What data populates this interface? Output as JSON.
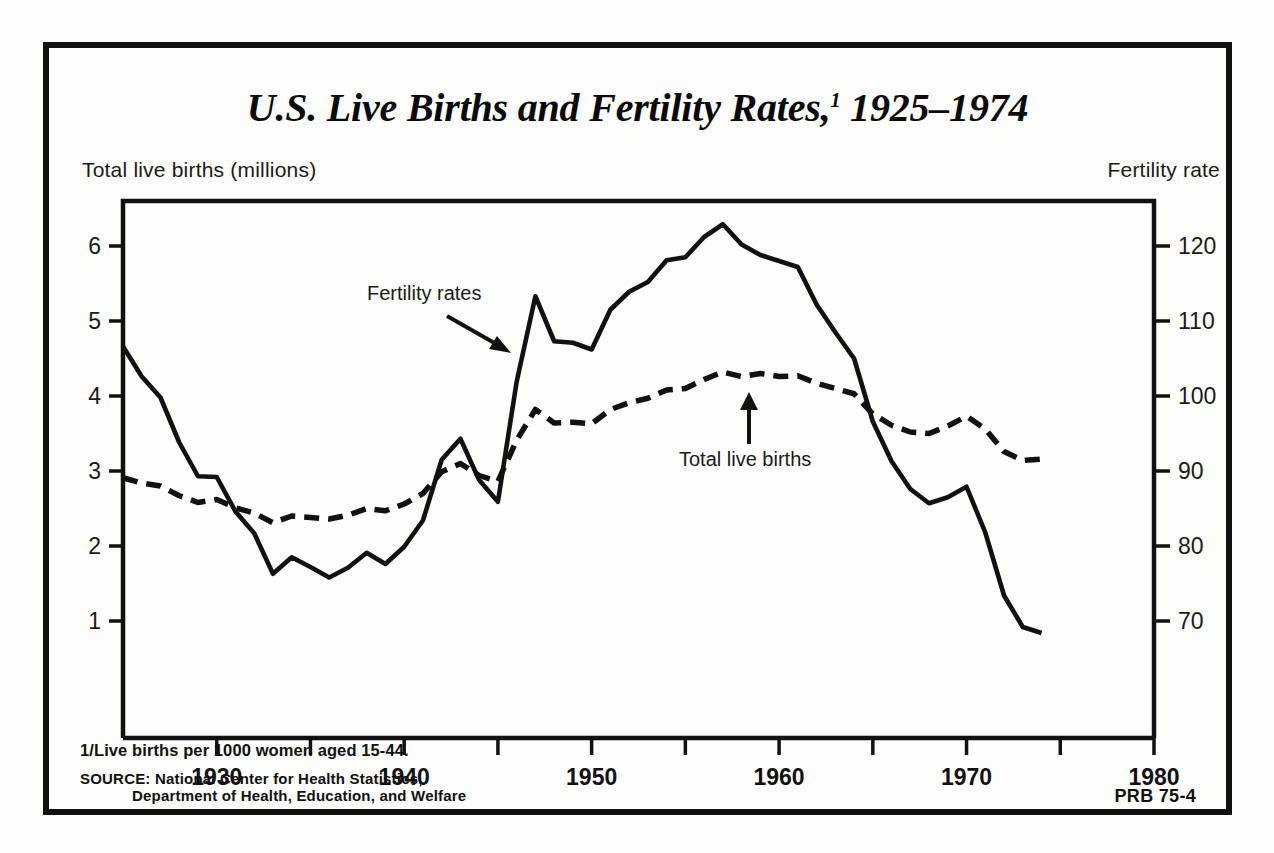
{
  "poster": {
    "title_main": "U.S. Live Births and Fertility Rates,",
    "title_footnote_marker": "1",
    "title_years": " 1925–1974",
    "footnote": "1/Live births per 1000 women aged 15-44.",
    "source_line1": "SOURCE: National Center for Health Statistics,",
    "source_line2": "Department of Health, Education, and Welfare",
    "publication_code": "PRB 75-4",
    "left_axis_caption": "Total live births (millions)",
    "right_axis_caption": "Fertility rate"
  },
  "chart_data": {
    "type": "line",
    "xlabel": "",
    "ylabel": "Total live births (millions)",
    "y2label": "Fertility rate",
    "xlim": [
      1925,
      1980
    ],
    "ylim": [
      0,
      6.6
    ],
    "y2lim": [
      60,
      126
    ],
    "grid": false,
    "legend_position": "inline-annotations",
    "xticks_major": [
      1930,
      1940,
      1950,
      1960,
      1970,
      1980
    ],
    "xticks_minor": [
      1935,
      1945,
      1955,
      1965,
      1975
    ],
    "yticks_left": [
      1,
      2,
      3,
      4,
      5,
      6
    ],
    "yticks_right": [
      70,
      80,
      90,
      100,
      110,
      120
    ],
    "annotations": [
      {
        "text": "Fertility rates",
        "points_to_series": "fertility_rate",
        "arrow": "down-right",
        "x": 1939,
        "y2": 112
      },
      {
        "text": "Total live births",
        "points_to_series": "total_live_births",
        "arrow": "up",
        "x": 1955,
        "y": 3.75
      }
    ],
    "x": [
      1925,
      1926,
      1927,
      1928,
      1929,
      1930,
      1931,
      1932,
      1933,
      1934,
      1935,
      1936,
      1937,
      1938,
      1939,
      1940,
      1941,
      1942,
      1943,
      1944,
      1945,
      1946,
      1947,
      1948,
      1949,
      1950,
      1951,
      1952,
      1953,
      1954,
      1955,
      1956,
      1957,
      1958,
      1959,
      1960,
      1961,
      1962,
      1963,
      1964,
      1965,
      1966,
      1967,
      1968,
      1969,
      1970,
      1971,
      1972,
      1973,
      1974
    ],
    "series": [
      {
        "name": "Fertility rates",
        "key": "fertility_rate",
        "axis": "right",
        "style": "solid",
        "units": "live births per 1000 women aged 15-44",
        "values": [
          106.6,
          102.6,
          99.8,
          93.8,
          89.3,
          89.2,
          84.6,
          81.7,
          76.3,
          78.5,
          77.2,
          75.8,
          77.1,
          79.1,
          77.6,
          79.9,
          83.4,
          91.5,
          94.3,
          88.8,
          85.9,
          101.9,
          113.3,
          107.3,
          107.1,
          106.2,
          111.5,
          113.9,
          115.2,
          118.1,
          118.5,
          121.2,
          122.9,
          120.2,
          118.8,
          118.0,
          117.2,
          112.2,
          108.5,
          105.0,
          96.6,
          91.3,
          87.6,
          85.7,
          86.5,
          87.9,
          81.8,
          73.4,
          69.2,
          68.4
        ]
      },
      {
        "name": "Total live births",
        "key": "total_live_births",
        "axis": "left",
        "style": "dashed",
        "units": "millions",
        "values": [
          2.91,
          2.84,
          2.8,
          2.67,
          2.58,
          2.62,
          2.51,
          2.44,
          2.31,
          2.4,
          2.38,
          2.36,
          2.41,
          2.5,
          2.47,
          2.56,
          2.7,
          2.99,
          3.1,
          2.94,
          2.86,
          3.41,
          3.82,
          3.64,
          3.65,
          3.63,
          3.82,
          3.91,
          3.97,
          4.08,
          4.1,
          4.22,
          4.32,
          4.26,
          4.3,
          4.26,
          4.27,
          4.17,
          4.1,
          4.03,
          3.76,
          3.61,
          3.52,
          3.5,
          3.6,
          3.73,
          3.56,
          3.26,
          3.14,
          3.16
        ]
      }
    ]
  }
}
